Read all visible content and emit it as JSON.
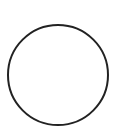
{
  "shape": {
    "type": "circle",
    "cx": 58,
    "cy": 75,
    "r": 50,
    "stroke": "#222222",
    "stroke_width": 2,
    "fill": "none"
  },
  "background": "#ffffff"
}
